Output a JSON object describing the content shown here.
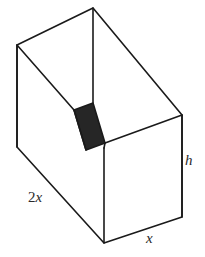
{
  "figure": {
    "canvas": {
      "width": 205,
      "height": 257
    },
    "background_color": "#ffffff",
    "line_color": "#1a1a1a",
    "shaded_color": "#262626",
    "labels": {
      "length": "2x",
      "width": "x",
      "height": "h"
    },
    "label_parts": {
      "length_coefficient": "2",
      "length_variable": "x",
      "width_variable": "x",
      "height_variable": "h"
    },
    "vertices": {
      "top_back_apex": [
        93,
        8
      ],
      "top_back_left": [
        17,
        45
      ],
      "top_front_right": [
        182,
        115
      ],
      "front_top_corner": [
        104,
        148
      ],
      "left_wall_bottom": [
        17,
        147
      ],
      "bottom_front_corner": [
        104,
        243
      ],
      "bottom_right_corner": [
        182,
        217
      ]
    },
    "shaded_panel": {
      "name": "front-rim-thickness",
      "points": [
        [
          74,
          110
        ],
        [
          93,
          103
        ],
        [
          105,
          143
        ],
        [
          86,
          150
        ]
      ]
    }
  }
}
